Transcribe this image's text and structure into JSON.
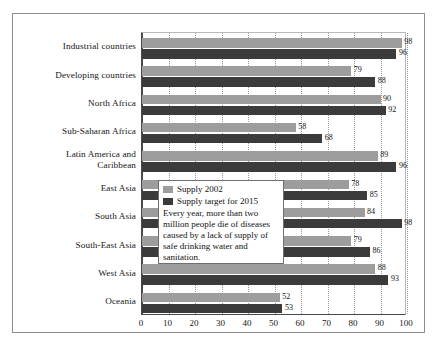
{
  "chart_data": {
    "type": "bar",
    "orientation": "horizontal",
    "title": "",
    "xlabel": "",
    "ylabel": "",
    "xlim": [
      0,
      100
    ],
    "xticks": [
      0,
      10,
      20,
      30,
      40,
      50,
      60,
      70,
      80,
      90,
      100
    ],
    "grid": true,
    "legend_position": "center",
    "categories": [
      "Industrial countries",
      "Developing countries",
      "North Africa",
      "Sub-Saharan Africa",
      "Latin America and Caribbean",
      "East Asia",
      "South Asia",
      "South-East Asia",
      "West Asia",
      "Oceania"
    ],
    "series": [
      {
        "name": "Supply 2002",
        "color": "#9d9d9d",
        "values": [
          98,
          79,
          90,
          58,
          89,
          78,
          84,
          79,
          88,
          52
        ]
      },
      {
        "name": "Supply target for 2015",
        "color": "#3b3b3b",
        "values": [
          96,
          88,
          92,
          68,
          96,
          85,
          98,
          86,
          93,
          53
        ]
      }
    ],
    "annotations": [
      "Every year, more than two million people die of diseases caused by a lack of supply of safe drinking water and sanitation."
    ]
  },
  "category_labels": [
    [
      "Industrial countries"
    ],
    [
      "Developing countries"
    ],
    [
      "North Africa"
    ],
    [
      "Sub-Saharan Africa"
    ],
    [
      "Latin America and",
      "Caribbean"
    ],
    [
      "East Asia"
    ],
    [
      "South Asia"
    ],
    [
      "South-East Asia"
    ],
    [
      "West Asia"
    ],
    [
      "Oceania"
    ]
  ],
  "legend": {
    "entries": [
      {
        "label": "Supply 2002",
        "color": "#9d9d9d"
      },
      {
        "label": "Supply target for 2015",
        "color": "#3b3b3b"
      }
    ],
    "note": "Every year, more than two million people die of diseases caused by a lack of supply of safe drinking water and sanitation."
  }
}
